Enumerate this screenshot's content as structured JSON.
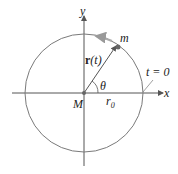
{
  "diagram": {
    "labels": {
      "y_axis": "y",
      "x_axis": "x",
      "mass": "m",
      "position_vector_bold": "r",
      "position_vector_arg": "(t)",
      "angle": "θ",
      "center": "M",
      "radius": "r",
      "radius_sub": "0",
      "time_marker": "t = 0"
    },
    "colors": {
      "circle": "#7a7a7a",
      "axes": "#555555",
      "vector": "#555555",
      "motion_arrow": "#a8a8a8",
      "point": "#666666"
    }
  }
}
